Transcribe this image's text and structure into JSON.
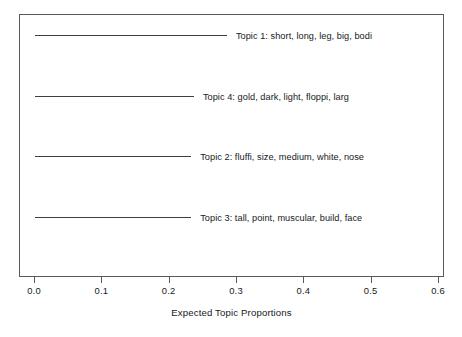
{
  "figure": {
    "top_remnant_text": "",
    "background_color": "#ffffff",
    "line_color": "#3c4044",
    "axis_color": "#55595d",
    "text_color": "#15191c"
  },
  "chart_data": {
    "type": "bar",
    "orientation": "horizontal",
    "title": "",
    "subtitle": "",
    "xlabel": "Expected Topic Proportions",
    "ylabel": "",
    "xlim": [
      0.0,
      0.6
    ],
    "grid": false,
    "legend": false,
    "xticks": [
      0.0,
      0.1,
      0.2,
      0.3,
      0.4,
      0.5,
      0.6
    ],
    "xticklabels": [
      "0.0",
      "0.1",
      "0.2",
      "0.3",
      "0.4",
      "0.5",
      "0.6"
    ],
    "categories": [
      "Topic 1: short, long, leg, big, bodi",
      "Topic 4: gold, dark, light, floppi, larg",
      "Topic 2: fluffi, size, medium, white, nose",
      "Topic 3: tall, point, muscular, build, face"
    ],
    "values": [
      0.285,
      0.236,
      0.232,
      0.232
    ],
    "bars": [
      {
        "label": "Topic 1: short, long, leg, big, bodi",
        "topic_number": 1,
        "terms": [
          "short",
          "long",
          "leg",
          "big",
          "bodi"
        ],
        "value": 0.285
      },
      {
        "label": "Topic 4: gold, dark, light, floppi, larg",
        "topic_number": 4,
        "terms": [
          "gold",
          "dark",
          "light",
          "floppi",
          "larg"
        ],
        "value": 0.236
      },
      {
        "label": "Topic 2: fluffi, size, medium, white, nose",
        "topic_number": 2,
        "terms": [
          "fluffi",
          "size",
          "medium",
          "white",
          "nose"
        ],
        "value": 0.232
      },
      {
        "label": "Topic 3: tall, point, muscular, build, face",
        "topic_number": 3,
        "terms": [
          "tall",
          "point",
          "muscular",
          "build",
          "face"
        ],
        "value": 0.232
      }
    ]
  }
}
